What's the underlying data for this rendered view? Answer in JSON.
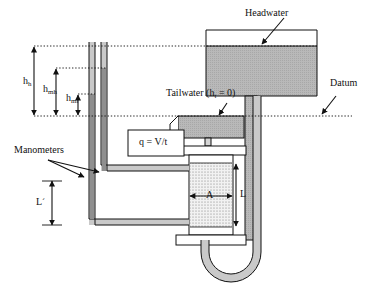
{
  "figure": {
    "type": "diagram",
    "background_color": "#ffffff",
    "line_color": "#111111",
    "water_fill_color": "#b3b3b3",
    "soil_fill_color": "#e8e8e8",
    "pipe_fill_color": "#c9c9c9"
  },
  "labels": {
    "headwater": "Headwater",
    "tailwater": "Tailwater (h",
    "tailwater_sub": "t",
    "tailwater_tail": " = 0)",
    "datum": "Datum",
    "manometers": "Manometers",
    "discharge_equation": "q  =  V/t",
    "h_head_base": "h",
    "h_head_sub": "h",
    "h_mh_base": "h",
    "h_mh_sub": "mh",
    "h_ml_base": "h",
    "h_ml_sub": "ml",
    "length_L": "L",
    "length_L_prime_base": "L",
    "length_L_prime_mark": "´",
    "area_A": "A"
  },
  "dimensions": {
    "h_head_description": "total head from headwater surface to datum",
    "h_mh_description": "head at upper manometer",
    "h_ml_description": "head at lower manometer",
    "L_description": "length of soil sample",
    "L_prime_description": "manometer separation distance",
    "A_description": "cross-sectional area of soil column"
  },
  "levels": {
    "headwater_surface_y": 46,
    "upper_manometer_y": 68,
    "lower_manometer_y": 94,
    "datum_y": 116
  }
}
